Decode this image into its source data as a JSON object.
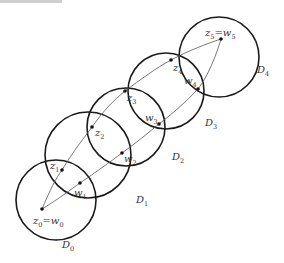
{
  "figure": {
    "disks": [
      {
        "label": "D",
        "sub": "0",
        "cx": 56,
        "cy": 200,
        "r": 40,
        "lx": 62,
        "ly": 248
      },
      {
        "label": "D",
        "sub": "1",
        "cx": 88,
        "cy": 155,
        "r": 43,
        "lx": 136,
        "ly": 203
      },
      {
        "label": "D",
        "sub": "2",
        "cx": 126,
        "cy": 127,
        "r": 39,
        "lx": 172,
        "ly": 160
      },
      {
        "label": "D",
        "sub": "3",
        "cx": 166,
        "cy": 91,
        "r": 38,
        "lx": 205,
        "ly": 126
      },
      {
        "label": "D",
        "sub": "4",
        "cx": 219,
        "cy": 57,
        "r": 40,
        "lx": 257,
        "ly": 73
      }
    ],
    "points": [
      {
        "name": "z0=w0",
        "main": "z",
        "sub": "0",
        "eq": "=w",
        "sub2": "0",
        "x": 42,
        "y": 209,
        "lx": 33,
        "ly": 224
      },
      {
        "name": "z1",
        "main": "z",
        "sub": "1",
        "x": 62,
        "y": 170,
        "lx": 50,
        "ly": 169
      },
      {
        "name": "w1",
        "main": "w",
        "sub": "1",
        "x": 80,
        "y": 183,
        "lx": 74,
        "ly": 196
      },
      {
        "name": "z2",
        "main": "z",
        "sub": "2",
        "x": 92,
        "y": 127,
        "lx": 95,
        "ly": 136
      },
      {
        "name": "w2",
        "main": "w",
        "sub": "2",
        "x": 122,
        "y": 153,
        "lx": 124,
        "ly": 162
      },
      {
        "name": "z3",
        "main": "z",
        "sub": "3",
        "x": 125,
        "y": 91,
        "lx": 127,
        "ly": 101
      },
      {
        "name": "w3",
        "main": "w",
        "sub": "3",
        "x": 159,
        "y": 124,
        "lx": 145,
        "ly": 121
      },
      {
        "name": "z4",
        "main": "z",
        "sub": "4",
        "x": 171,
        "y": 60,
        "lx": 173,
        "ly": 71
      },
      {
        "name": "w4",
        "main": "w",
        "sub": "4",
        "x": 198,
        "y": 89,
        "lx": 184,
        "ly": 84
      },
      {
        "name": "z5=w5",
        "main": "z",
        "sub": "5",
        "eq": "=w",
        "sub2": "5",
        "x": 221,
        "y": 39,
        "lx": 205,
        "ly": 36
      }
    ],
    "z_path": "M42,209 C50,190 56,178 62,170 C74,150 84,138 92,127 C104,110 114,100 125,91 C140,80 156,68 171,60 C190,50 206,44 221,39",
    "w_path": "M42,209 C60,198 70,190 80,183 C96,172 110,162 122,153 C136,143 148,133 159,124 C172,114 186,102 198,89 C208,76 216,56 221,39"
  }
}
